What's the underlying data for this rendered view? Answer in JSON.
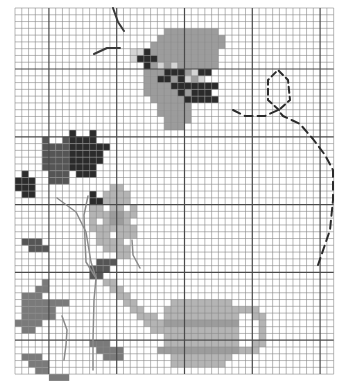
{
  "pattern": {
    "title": "Cross-stitch pattern: butterfly, flowers and watering can",
    "grid": {
      "origin_x": 15,
      "origin_y": 8,
      "cell": 6.78,
      "cols": 47,
      "rows": 54,
      "major_every": 10,
      "major_offset_col": 5,
      "major_offset_row": 9,
      "minor_color": "#8a8a8a",
      "major_color": "#4a4a4a"
    },
    "palette": {
      "dark": "#2b2b2b",
      "darkgray": "#555555",
      "midgray": "#7a7a7a",
      "gray": "#9c9c9c",
      "lightgray": "#b4b4b4",
      "pale": "#d4d4d4"
    },
    "shapes": [
      {
        "name": "butterfly-wing",
        "color": "gray",
        "rects": [
          [
            22,
            3,
            8,
            1
          ],
          [
            21,
            4,
            10,
            1
          ],
          [
            20,
            5,
            11,
            1
          ],
          [
            18,
            6,
            12,
            1
          ],
          [
            18,
            7,
            12,
            1
          ],
          [
            19,
            8,
            11,
            1
          ],
          [
            19,
            9,
            10,
            1
          ],
          [
            19,
            10,
            9,
            1
          ],
          [
            19,
            11,
            7,
            1
          ],
          [
            19,
            12,
            7,
            1
          ],
          [
            20,
            13,
            6,
            1
          ],
          [
            21,
            14,
            5,
            1
          ],
          [
            21,
            15,
            5,
            1
          ],
          [
            22,
            16,
            4,
            1
          ],
          [
            22,
            17,
            3,
            1
          ]
        ]
      },
      {
        "name": "butterfly-edge",
        "color": "pale",
        "rects": [
          [
            17,
            6,
            2,
            1
          ],
          [
            17,
            7,
            1,
            1
          ],
          [
            21,
            8,
            1,
            1
          ],
          [
            23,
            8,
            1,
            1
          ],
          [
            24,
            9,
            1,
            1
          ],
          [
            26,
            9,
            1,
            1
          ],
          [
            27,
            10,
            1,
            1
          ],
          [
            25,
            10,
            1,
            1
          ],
          [
            26,
            11,
            1,
            1
          ]
        ]
      },
      {
        "name": "butterfly-spots",
        "color": "dark",
        "rects": [
          [
            19,
            6,
            1,
            1
          ],
          [
            18,
            7,
            3,
            1
          ],
          [
            19,
            8,
            1,
            1
          ],
          [
            22,
            9,
            3,
            1
          ],
          [
            21,
            10,
            2,
            1
          ],
          [
            24,
            10,
            1,
            1
          ],
          [
            27,
            9,
            2,
            1
          ],
          [
            23,
            11,
            2,
            1
          ],
          [
            25,
            11,
            3,
            1
          ],
          [
            26,
            12,
            3,
            1
          ],
          [
            24,
            12,
            1,
            1
          ],
          [
            28,
            11,
            2,
            1
          ],
          [
            26,
            13,
            2,
            1
          ],
          [
            28,
            13,
            2,
            1
          ],
          [
            25,
            13,
            1,
            1
          ]
        ]
      },
      {
        "name": "tulip-left",
        "color": "darkgray",
        "rects": [
          [
            4,
            19,
            1,
            1
          ],
          [
            7,
            19,
            1,
            1
          ],
          [
            4,
            20,
            2,
            1
          ],
          [
            6,
            20,
            2,
            1
          ],
          [
            4,
            21,
            5,
            1
          ],
          [
            4,
            22,
            5,
            1
          ],
          [
            4,
            23,
            5,
            1
          ],
          [
            5,
            24,
            3,
            1
          ],
          [
            5,
            25,
            3,
            1
          ]
        ]
      },
      {
        "name": "tulip-right",
        "color": "dark",
        "rects": [
          [
            8,
            18,
            1,
            1
          ],
          [
            11,
            18,
            1,
            1
          ],
          [
            8,
            19,
            2,
            1
          ],
          [
            10,
            19,
            2,
            1
          ],
          [
            8,
            20,
            5,
            1
          ],
          [
            8,
            21,
            5,
            1
          ],
          [
            8,
            22,
            5,
            1
          ],
          [
            8,
            23,
            4,
            1
          ],
          [
            9,
            24,
            3,
            1
          ],
          [
            12,
            20,
            1,
            1
          ],
          [
            13,
            20,
            1,
            1
          ]
        ]
      },
      {
        "name": "small-bud-left",
        "color": "dark",
        "rects": [
          [
            1,
            24,
            1,
            1
          ],
          [
            0,
            25,
            3,
            1
          ],
          [
            0,
            26,
            3,
            1
          ],
          [
            1,
            27,
            2,
            1
          ]
        ]
      },
      {
        "name": "small-bud-mid",
        "color": "dark",
        "rects": [
          [
            11,
            27,
            1,
            1
          ],
          [
            11,
            28,
            2,
            1
          ],
          [
            11,
            29,
            1,
            1
          ]
        ]
      },
      {
        "name": "flower-petals",
        "color": "lightgray",
        "rects": [
          [
            14,
            26,
            2,
            1
          ],
          [
            13,
            27,
            4,
            1
          ],
          [
            13,
            28,
            4,
            1
          ],
          [
            11,
            29,
            7,
            1
          ],
          [
            11,
            30,
            7,
            1
          ],
          [
            11,
            31,
            7,
            1
          ],
          [
            11,
            32,
            7,
            1
          ],
          [
            12,
            33,
            6,
            1
          ],
          [
            12,
            34,
            5,
            1
          ],
          [
            13,
            35,
            4,
            1
          ],
          [
            15,
            36,
            2,
            1
          ]
        ]
      },
      {
        "name": "flower-center",
        "color": "gray",
        "rects": [
          [
            14,
            30,
            2,
            2
          ]
        ]
      },
      {
        "name": "flower-gaps",
        "color": "white",
        "rects": [
          [
            13,
            29,
            1,
            1
          ],
          [
            16,
            29,
            1,
            1
          ],
          [
            12,
            31,
            1,
            1
          ],
          [
            17,
            31,
            1,
            1
          ],
          [
            14,
            33,
            1,
            1
          ],
          [
            16,
            34,
            1,
            1
          ]
        ]
      },
      {
        "name": "leaf-top-left",
        "color": "darkgray",
        "rects": [
          [
            1,
            34,
            3,
            1
          ],
          [
            2,
            35,
            3,
            1
          ]
        ]
      },
      {
        "name": "leaf-mid",
        "color": "darkgray",
        "rects": [
          [
            12,
            37,
            3,
            1
          ],
          [
            11,
            38,
            3,
            1
          ],
          [
            11,
            39,
            2,
            1
          ]
        ]
      },
      {
        "name": "leaf-cluster",
        "color": "midgray",
        "rects": [
          [
            4,
            40,
            1,
            1
          ],
          [
            3,
            41,
            2,
            1
          ],
          [
            1,
            42,
            3,
            1
          ],
          [
            1,
            43,
            7,
            1
          ],
          [
            1,
            44,
            5,
            1
          ],
          [
            1,
            45,
            5,
            1
          ],
          [
            0,
            46,
            4,
            1
          ],
          [
            1,
            47,
            2,
            1
          ]
        ]
      },
      {
        "name": "leaf-bottom-left",
        "color": "midgray",
        "rects": [
          [
            1,
            51,
            3,
            1
          ],
          [
            2,
            52,
            3,
            1
          ],
          [
            3,
            53,
            2,
            1
          ],
          [
            5,
            54,
            3,
            1
          ]
        ]
      },
      {
        "name": "leaf-bottom-mid",
        "color": "midgray",
        "rects": [
          [
            11,
            49,
            3,
            1
          ],
          [
            12,
            50,
            4,
            1
          ],
          [
            13,
            51,
            3,
            1
          ]
        ]
      },
      {
        "name": "spout",
        "color": "lightgray",
        "rects": [
          [
            13,
            40,
            2,
            1
          ],
          [
            14,
            41,
            2,
            1
          ],
          [
            15,
            42,
            2,
            1
          ],
          [
            16,
            43,
            2,
            1
          ],
          [
            17,
            44,
            2,
            1
          ],
          [
            18,
            45,
            3,
            1
          ],
          [
            19,
            46,
            4,
            1
          ],
          [
            20,
            47,
            2,
            1
          ]
        ]
      },
      {
        "name": "can-body",
        "color": "lightgray",
        "rects": [
          [
            23,
            43,
            9,
            1
          ],
          [
            22,
            44,
            11,
            2
          ],
          [
            22,
            46,
            11,
            1
          ],
          [
            22,
            47,
            11,
            2
          ],
          [
            22,
            49,
            11,
            1
          ],
          [
            22,
            50,
            11,
            1
          ],
          [
            23,
            51,
            9,
            1
          ],
          [
            23,
            52,
            8,
            1
          ]
        ]
      },
      {
        "name": "can-stripe-top",
        "color": "gray",
        "rects": [
          [
            22,
            46,
            11,
            1
          ]
        ]
      },
      {
        "name": "can-stripe-bottom",
        "color": "gray",
        "rects": [
          [
            21,
            50,
            12,
            1
          ]
        ]
      },
      {
        "name": "can-handle",
        "color": "lightgray",
        "rects": [
          [
            33,
            44,
            3,
            1
          ],
          [
            35,
            45,
            2,
            1
          ],
          [
            36,
            46,
            1,
            3
          ],
          [
            35,
            49,
            2,
            1
          ],
          [
            33,
            50,
            3,
            1
          ]
        ]
      }
    ],
    "backstitch": [
      {
        "name": "antenna-top",
        "color": "#3a3a3a",
        "width": 2,
        "points": [
          [
            113,
            8
          ],
          [
            118,
            22
          ],
          [
            124,
            31
          ]
        ]
      },
      {
        "name": "antenna-side",
        "color": "#3a3a3a",
        "width": 2,
        "points": [
          [
            94,
            54
          ],
          [
            107,
            48
          ],
          [
            120,
            48
          ]
        ]
      },
      {
        "name": "flight-path",
        "color": "#2b2b2b",
        "width": 2,
        "dash": "8,5",
        "points": [
          [
            233,
            110
          ],
          [
            245,
            116
          ],
          [
            265,
            116
          ],
          [
            278,
            110
          ],
          [
            283,
            116
          ],
          [
            300,
            124
          ],
          [
            313,
            139
          ],
          [
            325,
            155
          ],
          [
            333,
            170
          ],
          [
            333,
            200
          ],
          [
            330,
            230
          ],
          [
            318,
            265
          ]
        ]
      },
      {
        "name": "flight-loop",
        "color": "#2b2b2b",
        "width": 2,
        "dash": "6,4",
        "points": [
          [
            279,
            110
          ],
          [
            268,
            100
          ],
          [
            268,
            80
          ],
          [
            278,
            70
          ],
          [
            288,
            80
          ],
          [
            290,
            100
          ],
          [
            279,
            110
          ]
        ]
      },
      {
        "name": "stem-left",
        "color": "#8a8a8a",
        "width": 1.5,
        "points": [
          [
            57,
            198
          ],
          [
            76,
            212
          ],
          [
            86,
            232
          ],
          [
            91,
            262
          ],
          [
            96,
            278
          ]
        ]
      },
      {
        "name": "stem-right",
        "color": "#8a8a8a",
        "width": 1.5,
        "points": [
          [
            88,
            196
          ],
          [
            84,
            215
          ],
          [
            85,
            240
          ],
          [
            86,
            262
          ],
          [
            96,
            278
          ]
        ]
      },
      {
        "name": "stem-main",
        "color": "#8a8a8a",
        "width": 1.5,
        "points": [
          [
            96,
            278
          ],
          [
            94,
            300
          ],
          [
            93,
            340
          ],
          [
            93,
            370
          ]
        ]
      },
      {
        "name": "stem-lower-left",
        "color": "#8a8a8a",
        "width": 1.5,
        "points": [
          [
            62,
            316
          ],
          [
            67,
            330
          ],
          [
            66,
            345
          ],
          [
            64,
            360
          ]
        ]
      },
      {
        "name": "spout-line",
        "color": "#8a8a8a",
        "width": 1.5,
        "points": [
          [
            132,
            240
          ],
          [
            133,
            255
          ],
          [
            140,
            268
          ]
        ]
      }
    ]
  }
}
